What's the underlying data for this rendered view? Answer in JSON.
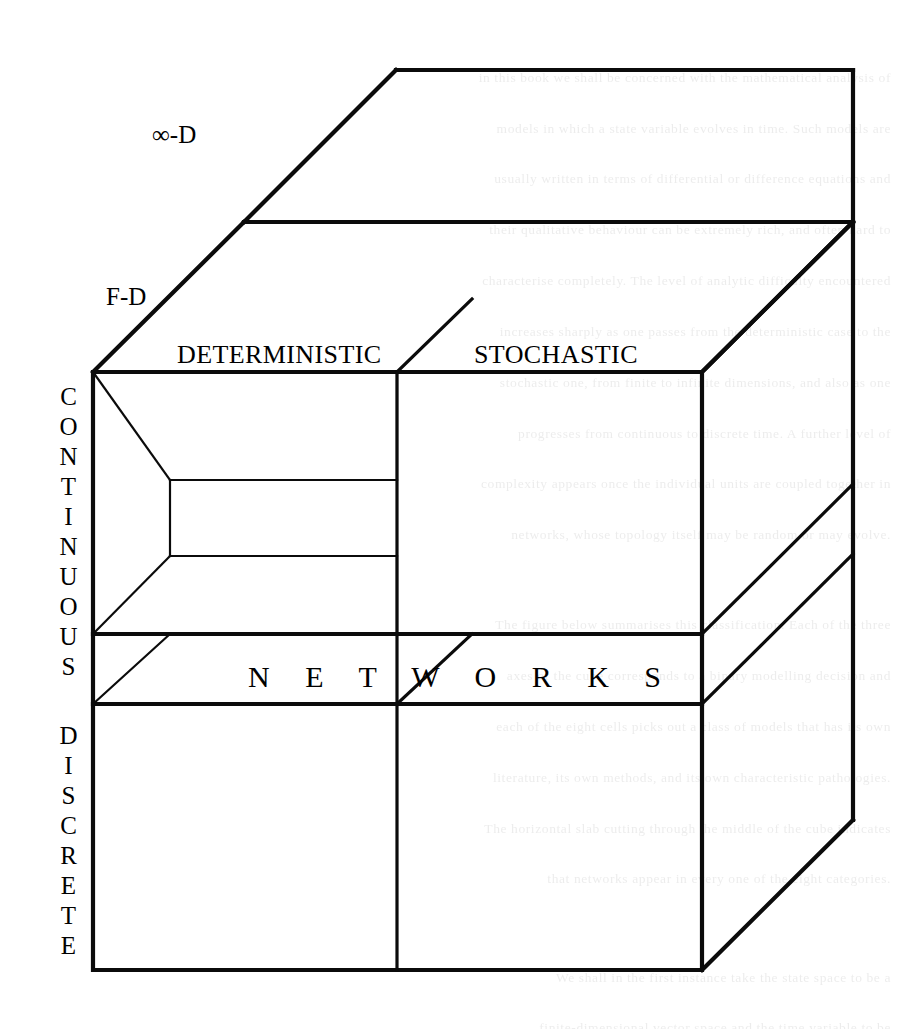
{
  "figure": {
    "type": "3d-cube-taxonomy-diagram",
    "title_text": "",
    "labels": {
      "infinite_dimensional": "∞-D",
      "finite_dimensional": "F-D",
      "deterministic": "DETERMINISTIC",
      "stochastic": "STOCHASTIC",
      "continuous": "CONTINUOUS",
      "discrete": "DISCRETE",
      "networks": "N E T W O R K S"
    },
    "axes": {
      "depth_axis_name": "dimensionality",
      "depth_axis_values": [
        "F-D",
        "∞-D"
      ],
      "horizontal_axis_name": "determinism",
      "horizontal_axis_values": [
        "DETERMINISTIC",
        "STOCHASTIC"
      ],
      "vertical_axis_name": "state-space",
      "vertical_axis_values": [
        "CONTINUOUS",
        "DISCRETE"
      ]
    },
    "highlighted_band": "N E T W O R K S",
    "colors": {
      "line": "#0b0b0b",
      "background": "#ffffff",
      "text": "#000000"
    }
  },
  "background_text": {
    "line_01": "                                                                                                       ",
    "left_column": "",
    "right_column": ""
  }
}
